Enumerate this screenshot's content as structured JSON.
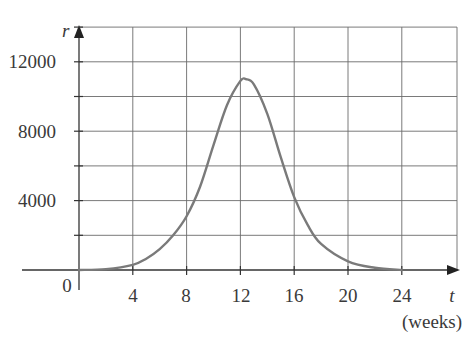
{
  "chart_data": {
    "type": "line",
    "title": "",
    "xlabel": "t",
    "xlabel_units": "(weeks)",
    "ylabel": "r",
    "xlim": [
      0,
      28
    ],
    "ylim": [
      0,
      14000
    ],
    "x_ticks": [
      0,
      4,
      8,
      12,
      16,
      20,
      24
    ],
    "x_tick_labels": [
      "4",
      "8",
      "12",
      "16",
      "20",
      "24"
    ],
    "y_ticks": [
      0,
      2000,
      4000,
      6000,
      8000,
      10000,
      12000,
      14000
    ],
    "y_tick_labels": [
      "4000",
      "8000",
      "12000"
    ],
    "origin_label": "0",
    "grid": true,
    "legend": null,
    "series": [
      {
        "name": "r(t)",
        "color": "#7a7a7a",
        "x": [
          0,
          2,
          4,
          5,
          6,
          7,
          8,
          9,
          10,
          11,
          12,
          12.4,
          13,
          14,
          15,
          16,
          17,
          18,
          20,
          22,
          24
        ],
        "values": [
          0,
          50,
          300,
          650,
          1200,
          2000,
          3100,
          4800,
          7200,
          9500,
          10900,
          11000,
          10700,
          9000,
          6500,
          4200,
          2600,
          1500,
          500,
          130,
          0
        ]
      }
    ]
  },
  "labels": {
    "y_var": "r",
    "x_var": "t",
    "x_units": "(weeks)",
    "origin": "0",
    "y_ticks": {
      "t4000": "4000",
      "t8000": "8000",
      "t12000": "12000"
    },
    "x_ticks": {
      "t4": "4",
      "t8": "8",
      "t12": "12",
      "t16": "16",
      "t20": "20",
      "t24": "24"
    }
  }
}
